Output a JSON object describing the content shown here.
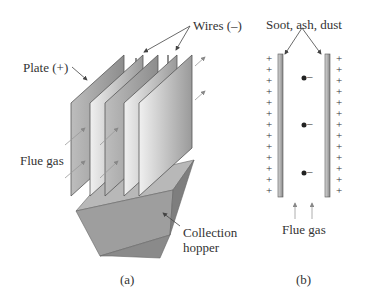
{
  "panel_a": {
    "labels": {
      "wires": "Wires (–)",
      "plate": "Plate (+)",
      "flue_gas": "Flue gas",
      "collection_hopper_line1": "Collection",
      "collection_hopper_line2": "hopper"
    },
    "caption": "(a)"
  },
  "panel_b": {
    "labels": {
      "deposits": "Soot, ash, dust",
      "flue_gas": "Flue gas"
    },
    "plate_charge_symbol": "+",
    "plus_count_per_side": 13,
    "particle_charge_symbol": "–",
    "particle_count": 3,
    "caption": "(b)"
  },
  "colors": {
    "plate_light": "#e6e6e6",
    "plate_dark": "#8a8a8a",
    "edge": "#555555",
    "text": "#333333"
  }
}
